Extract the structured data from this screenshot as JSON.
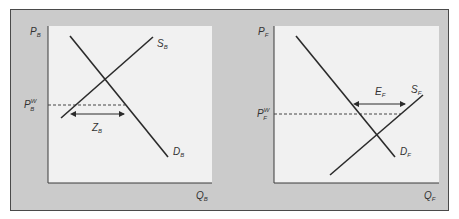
{
  "colors": {
    "frame_bg": "#cbcbcb",
    "plot_bg": "#f1f1f1",
    "line": "#2b2b2b",
    "border": "#4a4a4a"
  },
  "panels": [
    {
      "id": "home",
      "y_axis_label": "P",
      "y_axis_sub": "B",
      "x_axis_label": "Q",
      "x_axis_sub": "B",
      "supply_label": "S",
      "supply_sub": "B",
      "demand_label": "D",
      "demand_sub": "B",
      "world_price_label": "P",
      "world_price_sup": "W",
      "world_price_sub": "B",
      "gap_label": "Z",
      "gap_sub": "B",
      "gap_meaning": "imports (excess demand at world price)"
    },
    {
      "id": "foreign",
      "y_axis_label": "P",
      "y_axis_sub": "F",
      "x_axis_label": "Q",
      "x_axis_sub": "F",
      "supply_label": "S",
      "supply_sub": "F",
      "demand_label": "D",
      "demand_sub": "F",
      "world_price_label": "P",
      "world_price_sup": "W",
      "world_price_sub": "F",
      "gap_label": "E",
      "gap_sub": "F",
      "gap_meaning": "exports (excess supply at world price)"
    }
  ]
}
